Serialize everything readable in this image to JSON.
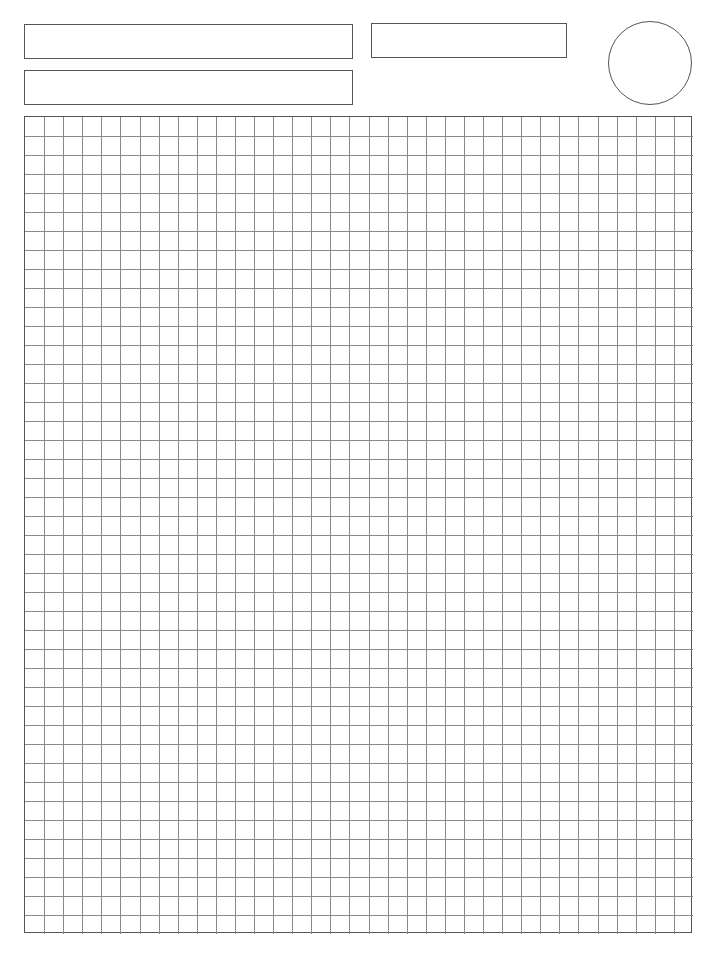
{
  "page": {
    "type": "graph-paper-worksheet",
    "background_color": "#ffffff"
  },
  "header": {
    "fields": [
      {
        "id": "field-1",
        "label": "",
        "value": ""
      },
      {
        "id": "field-2",
        "label": "",
        "value": ""
      },
      {
        "id": "field-3",
        "label": "",
        "value": ""
      }
    ],
    "circle_field": {
      "label": "",
      "value": ""
    }
  },
  "grid": {
    "columns": 35,
    "rows": 43,
    "cell_size_px": 19.1,
    "line_color": "#8a8a8a",
    "border_color": "#555555"
  }
}
